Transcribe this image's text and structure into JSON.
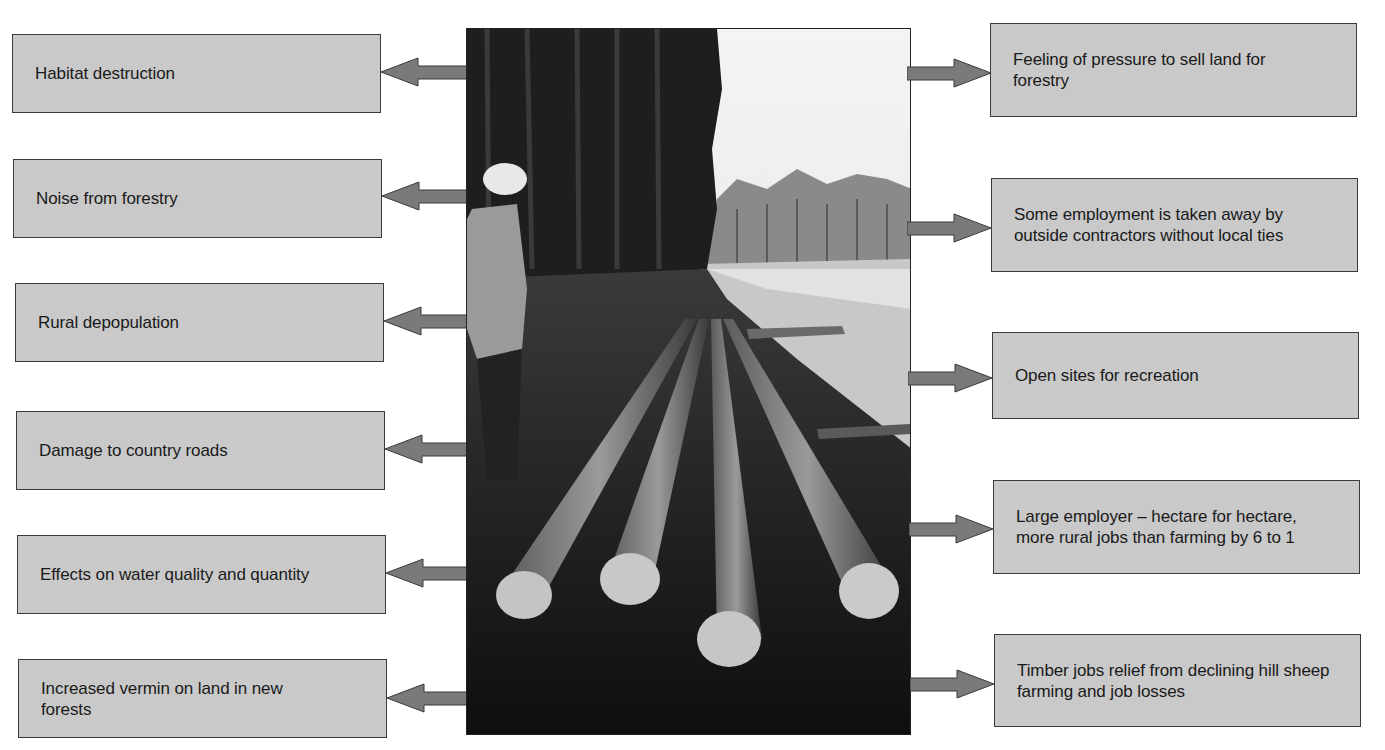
{
  "diagram": {
    "photo": {
      "description": "Forestry workers with felled logs beside a forest road"
    },
    "colors": {
      "box_fill": "#c9c9c9",
      "box_border": "#3a3a3a",
      "arrow_fill": "#7a7a7a",
      "text": "#1a1a1a"
    },
    "left_boxes": [
      {
        "label": "Habitat destruction"
      },
      {
        "label": "Noise from forestry"
      },
      {
        "label": "Rural depopulation"
      },
      {
        "label": "Damage to country roads"
      },
      {
        "label": "Effects on water quality and quantity"
      },
      {
        "label": "Increased vermin on land in new forests"
      }
    ],
    "right_boxes": [
      {
        "label": "Feeling of pressure to sell land for forestry"
      },
      {
        "label": "Some employment is taken away by outside contractors without local ties"
      },
      {
        "label": "Open sites for recreation"
      },
      {
        "label": "Large employer – hectare for hectare, more rural jobs than farming by 6 to 1"
      },
      {
        "label": "Timber jobs relief from declining hill sheep farming and job losses"
      }
    ]
  }
}
